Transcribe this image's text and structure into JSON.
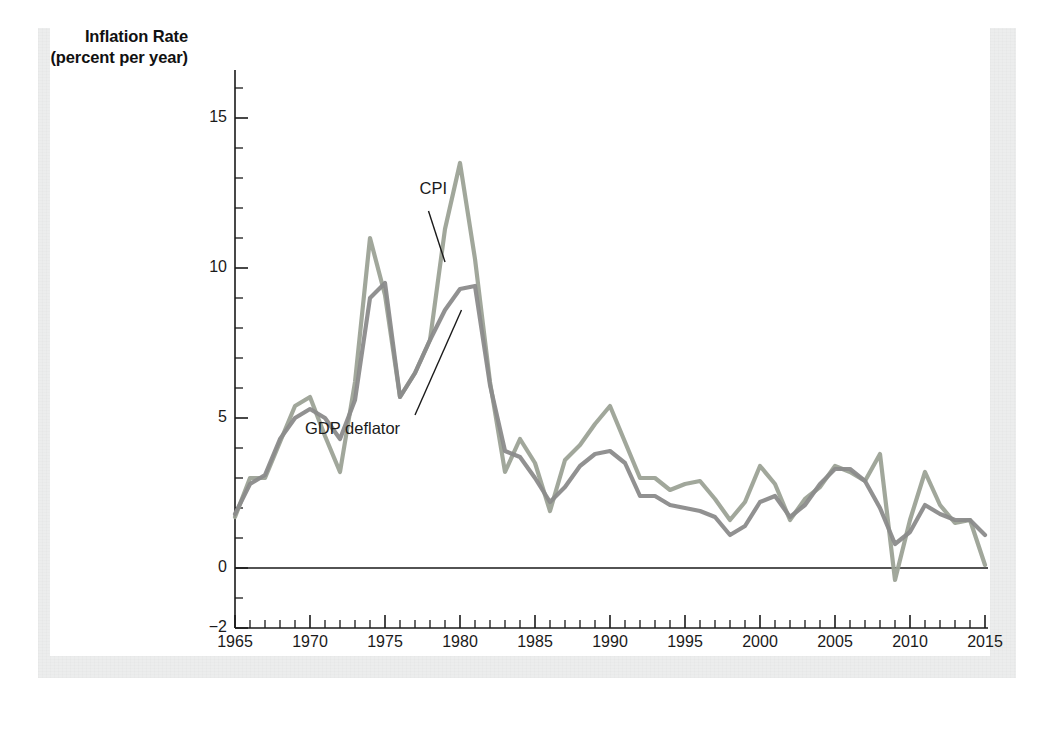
{
  "figure": {
    "y_axis_title_line1": "Inflation Rate",
    "y_axis_title_line2": "(percent per year)"
  },
  "ghost_text": [
    {
      "text": "nt  of   1  n   t      1 ct   t   r    t",
      "x": 610,
      "y": 52
    },
    {
      "text": "and  f rm   n    n        flat    n  r   d",
      "x": 430,
      "y": 112
    },
    {
      "text": "t  h     t      g r  t   r    n  t  h     d  n  t    m   n   n   th",
      "x": 60,
      "y": 330
    },
    {
      "text": "n   r   t   d     t       b        n     t    n     n     t  rm",
      "x": 58,
      "y": 358
    },
    {
      "text": "r  d   t     h    n          d      l   n     d   th    r     n   th",
      "x": 58,
      "y": 386
    },
    {
      "text": "c    n    b    f    r      n      t    r        m    d    n    n",
      "x": 58,
      "y": 414
    },
    {
      "text": "n   t   r   t     n      f   r      r    t   n   n      d   r       n",
      "x": 58,
      "y": 442
    },
    {
      "text": "h    n     r    t    n    d    n   r        f    r   m     b   t",
      "x": 58,
      "y": 506
    },
    {
      "text": "r   n      t     n   n    d   n     m      r    n    t    r      n",
      "x": 58,
      "y": 534
    },
    {
      "text": "r   th    d    n    n    t   r   m     t   d   f   l   t   r    n    d",
      "x": 58,
      "y": 590
    },
    {
      "text": "n    t     f    t      n    m   n     l    n",
      "x": 58,
      "y": 618
    }
  ],
  "chart_data": {
    "type": "line",
    "title": "",
    "xlabel": "",
    "ylabel": "Inflation Rate (percent per year)",
    "xlim": [
      1965,
      2015
    ],
    "ylim": [
      -2,
      16
    ],
    "y_ticks_major": [
      "15",
      "10",
      "5",
      "0",
      "−2"
    ],
    "y_tick_major_values": [
      15,
      10,
      5,
      0,
      -2
    ],
    "y_tick_minor_step": 1,
    "x_ticks_major": [
      "1965",
      "1970",
      "1975",
      "1980",
      "1985",
      "1990",
      "1995",
      "2000",
      "2005",
      "2010",
      "2015"
    ],
    "x_tick_major_values": [
      1965,
      1970,
      1975,
      1980,
      1985,
      1990,
      1995,
      2000,
      2005,
      2010,
      2015
    ],
    "x_tick_minor_step": 1,
    "grid": false,
    "legend_position": "inline-annotations",
    "annotations": [
      {
        "name": "cpi-label",
        "text": "CPI",
        "x": 1977.3,
        "y": 12.6
      },
      {
        "name": "gdp-deflator-label",
        "text": "GDP deflator",
        "x": 1974.2,
        "y": 4.6
      }
    ],
    "x": [
      1965,
      1966,
      1967,
      1968,
      1969,
      1970,
      1971,
      1972,
      1973,
      1974,
      1975,
      1976,
      1977,
      1978,
      1979,
      1980,
      1981,
      1982,
      1983,
      1984,
      1985,
      1986,
      1987,
      1988,
      1989,
      1990,
      1991,
      1992,
      1993,
      1994,
      1995,
      1996,
      1997,
      1998,
      1999,
      2000,
      2001,
      2002,
      2003,
      2004,
      2005,
      2006,
      2007,
      2008,
      2009,
      2010,
      2011,
      2012,
      2013,
      2014,
      2015
    ],
    "series": [
      {
        "name": "CPI",
        "color": "#9ca296",
        "values": [
          1.7,
          3.0,
          3.0,
          4.2,
          5.4,
          5.7,
          4.4,
          3.2,
          6.2,
          11.0,
          9.1,
          5.7,
          6.5,
          7.6,
          11.3,
          13.5,
          10.3,
          6.2,
          3.2,
          4.3,
          3.5,
          1.9,
          3.6,
          4.1,
          4.8,
          5.4,
          4.2,
          3.0,
          3.0,
          2.6,
          2.8,
          2.9,
          2.3,
          1.6,
          2.2,
          3.4,
          2.8,
          1.6,
          2.3,
          2.7,
          3.4,
          3.2,
          2.9,
          3.8,
          -0.4,
          1.6,
          3.2,
          2.1,
          1.5,
          1.6,
          0.1
        ]
      },
      {
        "name": "GDP deflator",
        "color": "#8b8b8b",
        "values": [
          1.8,
          2.8,
          3.1,
          4.3,
          5.0,
          5.3,
          5.0,
          4.3,
          5.6,
          9.0,
          9.5,
          5.7,
          6.5,
          7.6,
          8.6,
          9.3,
          9.4,
          6.1,
          3.9,
          3.7,
          3.0,
          2.2,
          2.7,
          3.4,
          3.8,
          3.9,
          3.5,
          2.4,
          2.4,
          2.1,
          2.0,
          1.9,
          1.7,
          1.1,
          1.4,
          2.2,
          2.4,
          1.7,
          2.1,
          2.8,
          3.3,
          3.3,
          2.9,
          2.0,
          0.8,
          1.2,
          2.1,
          1.8,
          1.6,
          1.6,
          1.1
        ]
      }
    ]
  }
}
